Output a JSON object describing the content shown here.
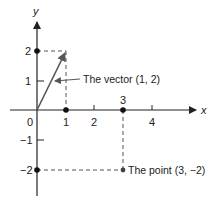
{
  "diagram": {
    "axes": {
      "x_label": "x",
      "y_label": "y",
      "origin_label": "0",
      "x_ticks": [
        "1",
        "2",
        "3",
        "4"
      ],
      "y_ticks": [
        "2",
        "1",
        "-1",
        "-2"
      ],
      "y_tick_display": [
        "2",
        "1",
        "−1",
        "−2"
      ]
    },
    "vector": {
      "components": [
        1,
        2
      ],
      "label": "The vector (1, 2)"
    },
    "point": {
      "coords": [
        3,
        -2
      ],
      "label": "The point (3, −2)"
    },
    "colors": {
      "ink": "#222222",
      "vector": "#555555",
      "dashed": "#555555",
      "background": "#ffffff"
    }
  }
}
